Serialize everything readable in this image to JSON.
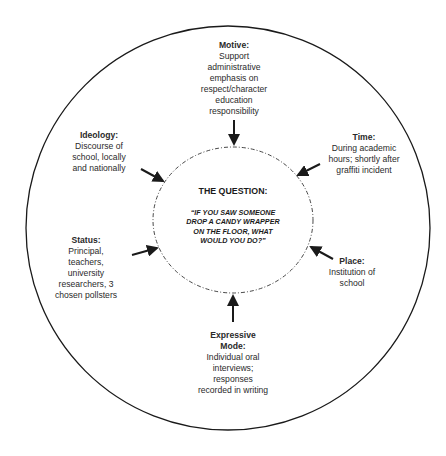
{
  "center": {
    "title": "THE QUESTION:",
    "question_lines": [
      "“IF YOU SAW SOMEONE",
      "DROP A CANDY WRAPPER",
      "ON THE FLOOR, WHAT",
      "WOULD YOU DO?”"
    ]
  },
  "nodes": {
    "motive": {
      "title": "Motive:",
      "lines": [
        "Support",
        "administrative",
        "emphasis on",
        "respect/character",
        "education",
        "responsibility"
      ]
    },
    "ideology": {
      "title": "Ideology:",
      "lines": [
        "Discourse of",
        "school, locally",
        "and nationally"
      ]
    },
    "time": {
      "title": "Time:",
      "lines": [
        "During academic",
        "hours; shortly after",
        "graffiti incident"
      ]
    },
    "status": {
      "title": "Status:",
      "lines": [
        "Principal,",
        "teachers,",
        "university",
        "researchers, 3",
        "chosen pollsters"
      ]
    },
    "place": {
      "title": "Place:",
      "lines": [
        "Institution of",
        "school"
      ]
    },
    "expressive_mode": {
      "title_lines": [
        "Expressive",
        "Mode:"
      ],
      "lines": [
        "Individual oral",
        "interviews;",
        "responses",
        "recorded in writing"
      ]
    }
  },
  "colors": {
    "stroke": "#1a1a1a",
    "text": "#2a2a2a",
    "background": "#ffffff"
  }
}
